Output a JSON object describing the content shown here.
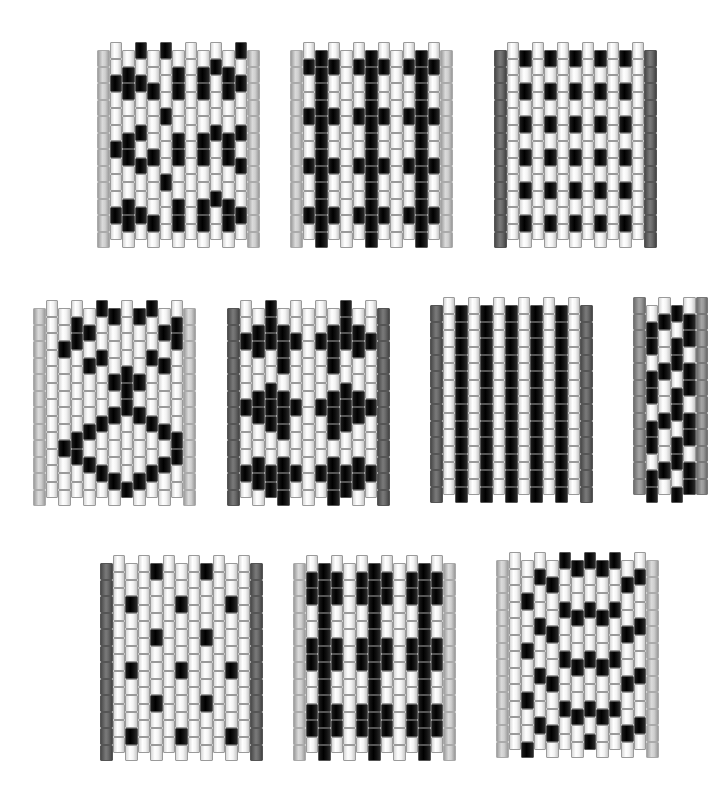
{
  "colors": {
    "W": "#ffffff",
    "B": "#000000",
    "L": "#c8c8c8",
    "M": "#8e8e8e",
    "D": "#5e5e5e"
  },
  "bead": {
    "w": 12.5,
    "h": 16.5
  },
  "panels": [
    {
      "name": "pattern-1-diamond-hourglass",
      "x": 97,
      "y": 42,
      "edge": "L",
      "edge_offset": 1,
      "cols": [
        {
          "o": 0,
          "b": "WWBWWWBWWWBW"
        },
        {
          "o": 1,
          "b": "WBBWWBBWWBBW"
        },
        {
          "o": 0,
          "b": "BWBWWBWBWWBW"
        },
        {
          "o": 1,
          "b": "WWBWWWBWWWBW"
        },
        {
          "o": 0,
          "b": "BWWWBWWWBWWW"
        },
        {
          "o": 1,
          "b": "WBBWWBBWWBBW"
        },
        {
          "o": 0,
          "b": "WWWWWWWWWWWW"
        },
        {
          "o": 1,
          "b": "WBBWWBBWWBBW"
        },
        {
          "o": 0,
          "b": "WBWWWBWWWBWW"
        },
        {
          "o": 1,
          "b": "WBBWWBBWWBBW"
        },
        {
          "o": 0,
          "b": "BWBWWBWBWWBW"
        }
      ]
    },
    {
      "name": "pattern-2-crosses",
      "x": 290,
      "y": 42,
      "edge": "L",
      "edge_offset": 1,
      "cols": [
        {
          "o": 0,
          "b": "WBWWBWWBWWBW"
        },
        {
          "o": 1,
          "b": "BBBBBBBBBBBB"
        },
        {
          "o": 0,
          "b": "WBWWBWWBWWBW"
        },
        {
          "o": 1,
          "b": "WWWWWWWWWWWW"
        },
        {
          "o": 0,
          "b": "WBWWBWWBWWBW"
        },
        {
          "o": 1,
          "b": "BBBBBBBBBBBB"
        },
        {
          "o": 0,
          "b": "WBWWBWWBWWBW"
        },
        {
          "o": 1,
          "b": "WWWWWWWWWWWW"
        },
        {
          "o": 0,
          "b": "WBWWBWWBWWBW"
        },
        {
          "o": 1,
          "b": "BBBBBBBBBBBB"
        },
        {
          "o": 0,
          "b": "WBWWBWWBWWBW"
        }
      ]
    },
    {
      "name": "pattern-3-dots-grid",
      "x": 494,
      "y": 42,
      "edge": "D",
      "edge_offset": 1,
      "cols": [
        {
          "o": 0,
          "b": "WWWWWWWWWWWW"
        },
        {
          "o": 1,
          "b": "BWBWBWBWBWBW"
        },
        {
          "o": 0,
          "b": "WWWWWWWWWWWW"
        },
        {
          "o": 1,
          "b": "BWBWBWBWBWBW"
        },
        {
          "o": 0,
          "b": "WWWWWWWWWWWW"
        },
        {
          "o": 1,
          "b": "BWBWBWBWBWBW"
        },
        {
          "o": 0,
          "b": "WWWWWWWWWWWW"
        },
        {
          "o": 1,
          "b": "BWBWBWBWBWBW"
        },
        {
          "o": 0,
          "b": "WWWWWWWWWWWW"
        },
        {
          "o": 1,
          "b": "BWBWBWBWBWBW"
        },
        {
          "o": 0,
          "b": "WWWWWWWWWWWW"
        }
      ]
    },
    {
      "name": "pattern-4-large-diamonds",
      "x": 33,
      "y": 300,
      "edge": "L",
      "edge_offset": 1,
      "cols": [
        {
          "o": 0,
          "b": "WWWWWWWWWWWW"
        },
        {
          "o": 1,
          "b": "WWBWWWWWBWWW"
        },
        {
          "o": 0,
          "b": "WBBWWWWWBBWW"
        },
        {
          "o": 1,
          "b": "WBWBWWWBWBWW"
        },
        {
          "o": 0,
          "b": "BWWBWWWBWWBW"
        },
        {
          "o": 1,
          "b": "BWWWBWBWWWBW"
        },
        {
          "o": 0,
          "b": "WWWWBBBWWWWB"
        },
        {
          "o": 1,
          "b": "BWWWBWBWWWBW"
        },
        {
          "o": 0,
          "b": "BWWBWWWBWWBW"
        },
        {
          "o": 1,
          "b": "WBWBWWWBWBWW"
        },
        {
          "o": 0,
          "b": "WBBWWWWWBBWW"
        }
      ]
    },
    {
      "name": "pattern-5-blob-diamonds",
      "x": 227,
      "y": 300,
      "edge": "D",
      "edge_offset": 1,
      "cols": [
        {
          "o": 0,
          "b": "WWBWWWBWWWBW"
        },
        {
          "o": 1,
          "b": "WBBWWBBWWBBW"
        },
        {
          "o": 0,
          "b": "BBBWWBBBWWBB"
        },
        {
          "o": 1,
          "b": "WBBBWBBBWBBB"
        },
        {
          "o": 0,
          "b": "WWBWWWBWWWBW"
        },
        {
          "o": 1,
          "b": "WWWWWWWWWWWW"
        },
        {
          "o": 0,
          "b": "WWBWWWBWWWBW"
        },
        {
          "o": 1,
          "b": "WBBBWBBBWBBB"
        },
        {
          "o": 0,
          "b": "BBBWWBBBWWBB"
        },
        {
          "o": 1,
          "b": "WBBWWBBWWBBW"
        },
        {
          "o": 0,
          "b": "WWBWWWBWWWBW"
        }
      ]
    },
    {
      "name": "pattern-6-vertical-stripes",
      "x": 430,
      "y": 297,
      "edge": "D",
      "edge_offset": 1,
      "cols": [
        {
          "o": 0,
          "b": "WWWWWWWWWWWW"
        },
        {
          "o": 1,
          "b": "BBBBBBBBBBBB"
        },
        {
          "o": 0,
          "b": "WWWWWWWWWWWW"
        },
        {
          "o": 1,
          "b": "BBBBBBBBBBBB"
        },
        {
          "o": 0,
          "b": "WWWWWWWWWWWW"
        },
        {
          "o": 1,
          "b": "BBBBBBBBBBBB"
        },
        {
          "o": 0,
          "b": "WWWWWWWWWWWW"
        },
        {
          "o": 1,
          "b": "BBBBBBBBBBBB"
        },
        {
          "o": 0,
          "b": "WWWWWWWWWWWW"
        },
        {
          "o": 1,
          "b": "BBBBBBBBBBBB"
        },
        {
          "o": 0,
          "b": "WWWWWWWWWWWW"
        }
      ]
    },
    {
      "name": "pattern-7-diagonal-spiral",
      "x": 633,
      "y": 297,
      "edge": "M",
      "edge_offset": 0,
      "cols": [
        {
          "o": 1,
          "b": "WBBWBBWBBWBB"
        },
        {
          "o": 0,
          "b": "WBWWBWWBWWBW"
        },
        {
          "o": 1,
          "b": "BWBBWBBWBBWB"
        },
        {
          "o": 0,
          "b": "WBBWBBWBBWBB"
        }
      ]
    },
    {
      "name": "pattern-8-sparse-dots",
      "x": 100,
      "y": 555,
      "edge": "D",
      "edge_offset": 1,
      "cols": [
        {
          "o": 0,
          "b": "WWWWWWWWWWWW"
        },
        {
          "o": 1,
          "b": "WWBWWWBWWWBW"
        },
        {
          "o": 0,
          "b": "WWWWWWWWWWWW"
        },
        {
          "o": 1,
          "b": "BWWWBWWWBWWW"
        },
        {
          "o": 0,
          "b": "WWWWWWWWWWWW"
        },
        {
          "o": 1,
          "b": "WWBWWWBWWWBW"
        },
        {
          "o": 0,
          "b": "WWWWWWWWWWWW"
        },
        {
          "o": 1,
          "b": "BWWWBWWWBWWW"
        },
        {
          "o": 0,
          "b": "WWWWWWWWWWWW"
        },
        {
          "o": 1,
          "b": "WWBWWWBWWWBW"
        },
        {
          "o": 0,
          "b": "WWWWWWWWWWWW"
        }
      ]
    },
    {
      "name": "pattern-9-bold-crosses",
      "x": 293,
      "y": 555,
      "edge": "L",
      "edge_offset": 1,
      "cols": [
        {
          "o": 0,
          "b": "WBBWWBBWWBBW"
        },
        {
          "o": 1,
          "b": "BBBBBBBBBBBB"
        },
        {
          "o": 0,
          "b": "WBBWWBBWWBBW"
        },
        {
          "o": 1,
          "b": "WWWWWWWWWWWW"
        },
        {
          "o": 0,
          "b": "WBBWWBBWWBBW"
        },
        {
          "o": 1,
          "b": "BBBBBBBBBBBB"
        },
        {
          "o": 0,
          "b": "WBBWWBBWWBBW"
        },
        {
          "o": 1,
          "b": "WWWWWWWWWWWW"
        },
        {
          "o": 0,
          "b": "WBBWWBBWWBBW"
        },
        {
          "o": 1,
          "b": "BBBBBBBBBBBB"
        },
        {
          "o": 0,
          "b": "WBBWWBBWWBBW"
        }
      ]
    },
    {
      "name": "pattern-10-chevrons",
      "x": 496,
      "y": 552,
      "edge": "L",
      "edge_offset": 1,
      "cols": [
        {
          "o": 0,
          "b": "WWWWWWWWWWWW"
        },
        {
          "o": 1,
          "b": "WWBWWBWWBWWB"
        },
        {
          "o": 0,
          "b": "WBWWBWWBWWBW"
        },
        {
          "o": 1,
          "b": "WBWWBWWBWWBW"
        },
        {
          "o": 0,
          "b": "BWWBWWBWWBWW"
        },
        {
          "o": 1,
          "b": "BWWBWWBWWBWW"
        },
        {
          "o": 0,
          "b": "BWWBWWBWWBWB"
        },
        {
          "o": 1,
          "b": "BWWBWWBWWBWW"
        },
        {
          "o": 0,
          "b": "BWWBWWBWWBWW"
        },
        {
          "o": 1,
          "b": "WBWWBWWBWWBW"
        },
        {
          "o": 0,
          "b": "WBWWBWWBWWBW"
        }
      ]
    }
  ]
}
